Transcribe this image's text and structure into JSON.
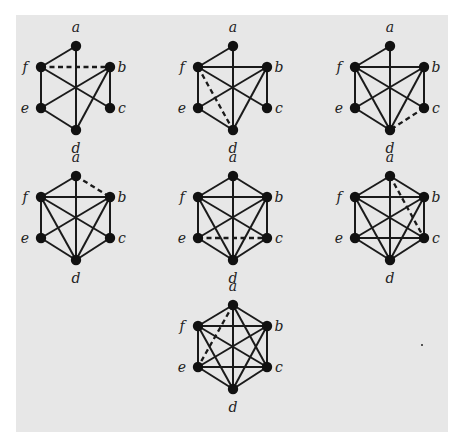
{
  "figure": {
    "background": "#e7e7e7",
    "node_color": "#111111",
    "edge_color": "#1a1a1a",
    "layout": {
      "offsets": {
        "a": [
          0,
          0
        ],
        "b": [
          34,
          21
        ],
        "c": [
          34,
          62
        ],
        "d": [
          0,
          84
        ],
        "e": [
          -35,
          62
        ],
        "f": [
          -35,
          21
        ]
      },
      "label_offsets": {
        "a": [
          0,
          -14
        ],
        "b": [
          12,
          5
        ],
        "c": [
          12,
          5
        ],
        "d": [
          0,
          23
        ],
        "e": [
          -16,
          5
        ],
        "f": [
          -16,
          5
        ]
      }
    },
    "graphs": [
      {
        "id": "graph-1",
        "origin": [
          76,
          46
        ],
        "solid": [
          [
            "a",
            "f"
          ],
          [
            "a",
            "d"
          ],
          [
            "f",
            "e"
          ],
          [
            "f",
            "c"
          ],
          [
            "b",
            "c"
          ],
          [
            "b",
            "e"
          ],
          [
            "b",
            "d"
          ],
          [
            "e",
            "d"
          ]
        ],
        "dashed": [
          [
            "f",
            "b"
          ]
        ]
      },
      {
        "id": "graph-2",
        "origin": [
          233,
          46
        ],
        "solid": [
          [
            "a",
            "f"
          ],
          [
            "a",
            "d"
          ],
          [
            "f",
            "b"
          ],
          [
            "f",
            "e"
          ],
          [
            "f",
            "c"
          ],
          [
            "b",
            "c"
          ],
          [
            "b",
            "e"
          ],
          [
            "b",
            "d"
          ],
          [
            "e",
            "d"
          ]
        ],
        "dashed": [
          [
            "f",
            "d"
          ]
        ]
      },
      {
        "id": "graph-3",
        "origin": [
          390,
          46
        ],
        "solid": [
          [
            "a",
            "f"
          ],
          [
            "a",
            "d"
          ],
          [
            "f",
            "b"
          ],
          [
            "f",
            "e"
          ],
          [
            "f",
            "c"
          ],
          [
            "f",
            "d"
          ],
          [
            "b",
            "c"
          ],
          [
            "b",
            "e"
          ],
          [
            "b",
            "d"
          ],
          [
            "e",
            "d"
          ]
        ],
        "dashed": [
          [
            "c",
            "d"
          ]
        ]
      },
      {
        "id": "graph-4",
        "origin": [
          76,
          176
        ],
        "solid": [
          [
            "a",
            "f"
          ],
          [
            "a",
            "d"
          ],
          [
            "f",
            "b"
          ],
          [
            "f",
            "e"
          ],
          [
            "f",
            "c"
          ],
          [
            "f",
            "d"
          ],
          [
            "b",
            "c"
          ],
          [
            "b",
            "e"
          ],
          [
            "b",
            "d"
          ],
          [
            "e",
            "d"
          ],
          [
            "c",
            "d"
          ]
        ],
        "dashed": [
          [
            "a",
            "b"
          ]
        ]
      },
      {
        "id": "graph-5",
        "origin": [
          233,
          176
        ],
        "solid": [
          [
            "a",
            "f"
          ],
          [
            "a",
            "b"
          ],
          [
            "a",
            "d"
          ],
          [
            "f",
            "b"
          ],
          [
            "f",
            "e"
          ],
          [
            "f",
            "c"
          ],
          [
            "f",
            "d"
          ],
          [
            "b",
            "c"
          ],
          [
            "b",
            "e"
          ],
          [
            "b",
            "d"
          ],
          [
            "e",
            "d"
          ],
          [
            "c",
            "d"
          ]
        ],
        "dashed": [
          [
            "e",
            "c"
          ]
        ]
      },
      {
        "id": "graph-6",
        "origin": [
          390,
          176
        ],
        "solid": [
          [
            "a",
            "f"
          ],
          [
            "a",
            "b"
          ],
          [
            "a",
            "d"
          ],
          [
            "f",
            "b"
          ],
          [
            "f",
            "e"
          ],
          [
            "f",
            "c"
          ],
          [
            "f",
            "d"
          ],
          [
            "b",
            "c"
          ],
          [
            "b",
            "e"
          ],
          [
            "b",
            "d"
          ],
          [
            "e",
            "d"
          ],
          [
            "c",
            "d"
          ],
          [
            "e",
            "c"
          ]
        ],
        "dashed": [
          [
            "a",
            "c"
          ]
        ]
      },
      {
        "id": "graph-7",
        "origin": [
          233,
          305
        ],
        "solid": [
          [
            "a",
            "f"
          ],
          [
            "a",
            "b"
          ],
          [
            "a",
            "d"
          ],
          [
            "a",
            "c"
          ],
          [
            "f",
            "b"
          ],
          [
            "f",
            "e"
          ],
          [
            "f",
            "c"
          ],
          [
            "f",
            "d"
          ],
          [
            "b",
            "c"
          ],
          [
            "b",
            "e"
          ],
          [
            "b",
            "d"
          ],
          [
            "e",
            "d"
          ],
          [
            "c",
            "d"
          ],
          [
            "e",
            "c"
          ]
        ],
        "dashed": [
          [
            "a",
            "e"
          ]
        ]
      }
    ],
    "node_labels": [
      "a",
      "b",
      "c",
      "d",
      "e",
      "f"
    ],
    "artifact_dot": [
      422,
      345
    ]
  }
}
